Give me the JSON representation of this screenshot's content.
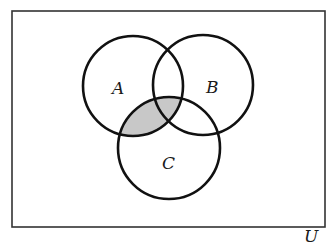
{
  "diagram": {
    "type": "venn",
    "universe": {
      "label": "U",
      "x": 12,
      "y": 11,
      "width": 313,
      "height": 216,
      "label_x": 304,
      "label_y": 242
    },
    "sets": [
      {
        "id": "A",
        "label": "A",
        "cx": 133,
        "cy": 86,
        "r": 50,
        "label_x": 112,
        "label_y": 94
      },
      {
        "id": "B",
        "label": "B",
        "cx": 203,
        "cy": 85,
        "r": 50,
        "label_x": 206,
        "label_y": 93
      },
      {
        "id": "C",
        "label": "C",
        "cx": 169,
        "cy": 148,
        "r": 51,
        "label_x": 162,
        "label_y": 169
      }
    ],
    "shaded_region": "A ∩ C",
    "colors": {
      "stroke": "#111111",
      "shade": "#c8c8c8",
      "border": "#333333",
      "background": "#ffffff"
    }
  }
}
